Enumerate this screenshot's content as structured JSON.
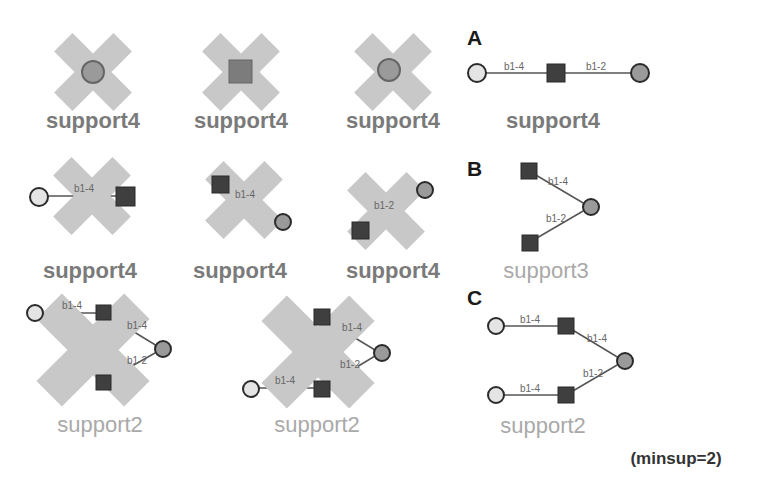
{
  "colors": {
    "cross": "#c8c8c8",
    "square_fill": "#3f3f3f",
    "circle_gray_fill": "#9a9a9a",
    "circle_light_fill": "#e4e4e4",
    "node_stroke": "#2a2a2a",
    "edge": "#555555"
  },
  "pruned_row1": [
    {
      "label": "support4",
      "node": "gray-circle"
    },
    {
      "label": "support4",
      "node": "square"
    },
    {
      "label": "support4",
      "node": "gray-circle"
    }
  ],
  "pruned_row2": [
    {
      "label": "support4",
      "edge": "b1-4"
    },
    {
      "label": "support4",
      "edge": "b1-4"
    },
    {
      "label": "support4",
      "edge": "b1-2"
    }
  ],
  "pruned_row3": [
    {
      "label": "support2",
      "edges": [
        "b1-4",
        "b1-4",
        "b1-2"
      ]
    },
    {
      "label": "support2",
      "edges": [
        "b1-4",
        "b1-4",
        "b1-2"
      ]
    }
  ],
  "patterns": {
    "A": {
      "letter": "A",
      "label": "support4",
      "edges": [
        "b1-4",
        "b1-2"
      ]
    },
    "B": {
      "letter": "B",
      "label": "support3",
      "edges": [
        "b1-4",
        "b1-2"
      ]
    },
    "C": {
      "letter": "C",
      "label": "support2",
      "edges": [
        "b1-4",
        "b1-4",
        "b1-4",
        "b1-2"
      ]
    }
  },
  "footnote": "(minsup=2)"
}
